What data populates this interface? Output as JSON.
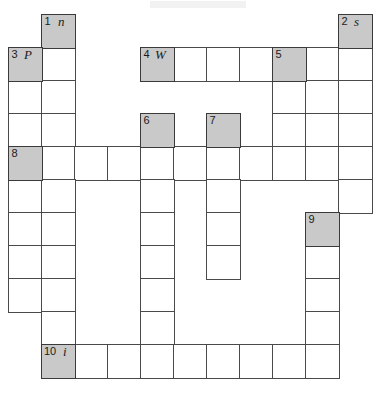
{
  "puzzle": {
    "kind": "crossword-grid",
    "columns": 11,
    "rows": 11,
    "cell_size": 33,
    "origin_x": 8,
    "origin_y": 14,
    "colors": {
      "clue_cell_fill": "#c9c9c9",
      "empty_cell_fill": "#ffffff",
      "grid_line": "#4a4a4a",
      "text": "#1c1c1c"
    },
    "clue_cells": [
      {
        "number": "1",
        "letter": "n",
        "col": 1,
        "row": 0
      },
      {
        "number": "2",
        "letter": "s",
        "col": 10,
        "row": 0
      },
      {
        "number": "3",
        "letter": "P",
        "col": 0,
        "row": 1
      },
      {
        "number": "4",
        "letter": "W",
        "col": 4,
        "row": 1
      },
      {
        "number": "5",
        "letter": "",
        "col": 8,
        "row": 1
      },
      {
        "number": "6",
        "letter": "",
        "col": 4,
        "row": 3
      },
      {
        "number": "7",
        "letter": "",
        "col": 6,
        "row": 3
      },
      {
        "number": "8",
        "letter": "",
        "col": 0,
        "row": 4
      },
      {
        "number": "9",
        "letter": "",
        "col": 9,
        "row": 6
      },
      {
        "number": "10",
        "letter": "i",
        "col": 1,
        "row": 10
      }
    ],
    "entries": [
      {
        "number": "1",
        "direction": "down",
        "start_col": 1,
        "start_row": 0,
        "length": 10
      },
      {
        "number": "2",
        "direction": "down",
        "start_col": 10,
        "start_row": 0,
        "length": 6
      },
      {
        "number": "3",
        "direction": "down",
        "start_col": 0,
        "start_row": 1,
        "length": 8
      },
      {
        "number": "4",
        "direction": "across",
        "start_col": 4,
        "start_row": 1,
        "length": 7
      },
      {
        "number": "5",
        "direction": "down",
        "start_col": 8,
        "start_row": 1,
        "length": 4
      },
      {
        "number": "6",
        "direction": "down",
        "start_col": 4,
        "start_row": 3,
        "length": 8
      },
      {
        "number": "7",
        "direction": "down",
        "start_col": 6,
        "start_row": 3,
        "length": 5
      },
      {
        "number": "8",
        "direction": "across",
        "start_col": 0,
        "start_row": 4,
        "length": 10
      },
      {
        "number": "9",
        "direction": "down",
        "start_col": 9,
        "start_row": 6,
        "length": 5
      },
      {
        "number": "10",
        "direction": "across",
        "start_col": 1,
        "start_row": 10,
        "length": 9
      }
    ],
    "extra_cells": [
      {
        "col": 9,
        "row": 1
      },
      {
        "col": 9,
        "row": 2
      },
      {
        "col": 9,
        "row": 3
      }
    ]
  }
}
